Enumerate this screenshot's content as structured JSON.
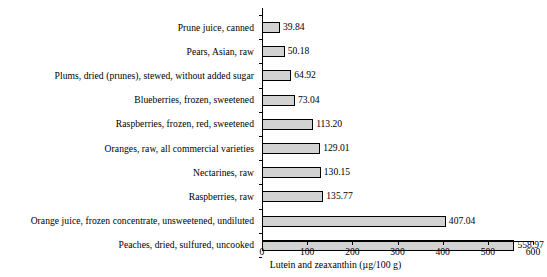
{
  "chart_data": {
    "type": "bar",
    "orientation": "horizontal",
    "title": "",
    "xlabel": "Lutein and zeaxanthin (µg/100 g)",
    "ylabel": "",
    "xlim": [
      0,
      600
    ],
    "xticks": [
      0,
      100,
      200,
      300,
      400,
      500,
      600
    ],
    "xtick_labels": [
      "0",
      "100",
      "200",
      "300",
      "400",
      "500",
      "600"
    ],
    "grid": false,
    "legend": null,
    "bar_fill_color": "#d2d2d2",
    "bar_edge_color": "#000000",
    "categories": [
      "Prune juice, canned",
      "Pears, Asian, raw",
      "Plums, dried (prunes), stewed, without added sugar",
      "Blueberries, frozen, sweetened",
      "Raspberries, frozen, red, sweetened",
      "Oranges, raw, all commercial varieties",
      "Nectarines, raw",
      "Raspberries, raw",
      "Orange juice, frozen concentrate, unsweetened, undiluted",
      "Peaches, dried, sulfured, uncooked"
    ],
    "values": [
      39.84,
      50.18,
      64.92,
      73.04,
      113.2,
      129.01,
      130.15,
      135.77,
      407.04,
      558.97
    ],
    "value_labels": [
      "39.84",
      "50.18",
      "64.92",
      "73.04",
      "113.20",
      "129.01",
      "130.15",
      "135.77",
      "407.04",
      "558.97"
    ]
  }
}
